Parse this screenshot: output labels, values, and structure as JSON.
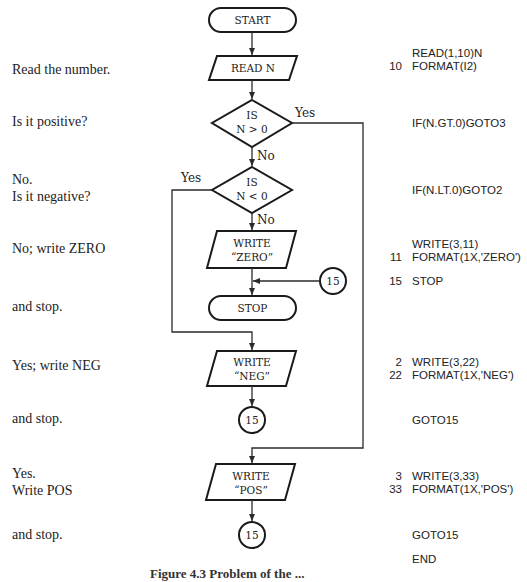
{
  "flowchart": {
    "start": "START",
    "read": "READ N",
    "decision1": {
      "line1": "IS",
      "line2": "N > 0",
      "yes_label": "Yes",
      "no_label": "No"
    },
    "decision2": {
      "line1": "IS",
      "line2": "N < 0",
      "yes_label": "Yes",
      "no_label": "No"
    },
    "write_zero": {
      "line1": "WRITE",
      "line2": "“ZERO”"
    },
    "connector_zero": "15",
    "stop": "STOP",
    "write_neg": {
      "line1": "WRITE",
      "line2": "“NEG”"
    },
    "connector_neg": "15",
    "write_pos": {
      "line1": "WRITE",
      "line2": "“POS”"
    },
    "connector_pos": "15"
  },
  "descriptions": [
    {
      "lines": [
        "Read the number."
      ]
    },
    {
      "lines": [
        "Is it positive?"
      ]
    },
    {
      "lines": [
        "No.",
        "Is it negative?"
      ]
    },
    {
      "lines": [
        "No; write ZERO"
      ]
    },
    {
      "lines": [
        "and stop."
      ]
    },
    {
      "lines": [
        "Yes; write NEG"
      ]
    },
    {
      "lines": [
        "and stop."
      ]
    },
    {
      "lines": [
        "Yes.",
        "Write POS"
      ]
    },
    {
      "lines": [
        "and stop."
      ]
    }
  ],
  "code": [
    {
      "label": "",
      "stmt": "READ(1,10)N"
    },
    {
      "label": "10",
      "stmt": "FORMAT(I2)"
    },
    {
      "label": "",
      "stmt": "IF(N.GT.0)GOTO3"
    },
    {
      "label": "",
      "stmt": "IF(N.LT.0)GOTO2"
    },
    {
      "label": "",
      "stmt": "WRITE(3,11)"
    },
    {
      "label": "11",
      "stmt": "FORMAT(1X,'ZERO')"
    },
    {
      "label": "15",
      "stmt": "STOP"
    },
    {
      "label": "2",
      "stmt": "WRITE(3,22)"
    },
    {
      "label": "22",
      "stmt": "FORMAT(1X,'NEG')"
    },
    {
      "label": "",
      "stmt": "GOTO15"
    },
    {
      "label": "3",
      "stmt": "WRITE(3,33)"
    },
    {
      "label": "33",
      "stmt": "FORMAT(1X,'POS')"
    },
    {
      "label": "",
      "stmt": "GOTO15"
    },
    {
      "label": "",
      "stmt": "END"
    }
  ],
  "caption": "Figure 4.3  Problem of the ..."
}
